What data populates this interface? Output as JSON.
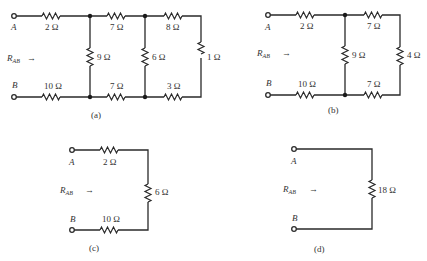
{
  "figure": {
    "circuits": [
      {
        "id": "a",
        "caption": "(a)",
        "terminal_a": "A",
        "terminal_b": "B",
        "r_label": "R",
        "r_sub": "AB",
        "resistors": {
          "top_left": "2 Ω",
          "bottom_left": "10 Ω",
          "shunt_1": "9 Ω",
          "top_mid": "7 Ω",
          "bottom_mid": "7 Ω",
          "shunt_2": "6 Ω",
          "top_right": "8 Ω",
          "bottom_right": "3 Ω",
          "end": "1 Ω"
        }
      },
      {
        "id": "b",
        "caption": "(b)",
        "terminal_a": "A",
        "terminal_b": "B",
        "r_label": "R",
        "r_sub": "AB",
        "resistors": {
          "top_left": "2 Ω",
          "bottom_left": "10 Ω",
          "shunt_1": "9 Ω",
          "top_mid": "7 Ω",
          "bottom_mid": "7 Ω",
          "end": "4 Ω"
        }
      },
      {
        "id": "c",
        "caption": "(c)",
        "terminal_a": "A",
        "terminal_b": "B",
        "r_label": "R",
        "r_sub": "AB",
        "resistors": {
          "top_left": "2 Ω",
          "bottom_left": "10 Ω",
          "end": "6 Ω"
        }
      },
      {
        "id": "d",
        "caption": "(d)",
        "terminal_a": "A",
        "terminal_b": "B",
        "r_label": "R",
        "r_sub": "AB",
        "resistors": {
          "end": "18 Ω"
        }
      }
    ],
    "arrow_symbol": "→"
  }
}
